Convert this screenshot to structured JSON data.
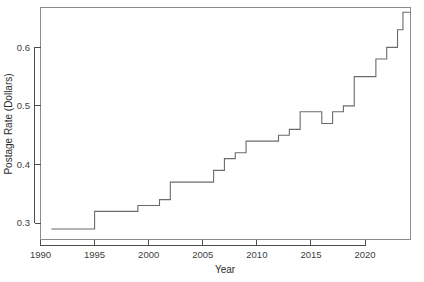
{
  "chart_data": {
    "type": "line",
    "step": "post",
    "title": "",
    "xlabel": "Year",
    "ylabel": "Postage Rate (Dollars)",
    "xlim": [
      1990,
      2024.2
    ],
    "ylim": [
      0.272,
      0.668
    ],
    "xticks": [
      1990,
      1995,
      2000,
      2005,
      2010,
      2015,
      2020
    ],
    "xtick_labels": [
      "1990",
      "1995",
      "2000",
      "2005",
      "2010",
      "2015",
      "2020"
    ],
    "yticks": [
      0.3,
      0.4,
      0.5,
      0.6
    ],
    "ytick_labels": [
      "0.3",
      "0.4",
      "0.5",
      "0.6"
    ],
    "grid": false,
    "legend": false,
    "line_color": "#6b6b6b",
    "x": [
      1991.0,
      1995.0,
      1999.0,
      2001.0,
      2002.0,
      2006.0,
      2007.0,
      2008.0,
      2009.0,
      2012.0,
      2013.0,
      2014.0,
      2016.0,
      2017.0,
      2018.0,
      2019.0,
      2021.0,
      2022.0,
      2023.0,
      2023.5,
      2024.2
    ],
    "values": [
      0.29,
      0.32,
      0.33,
      0.34,
      0.37,
      0.39,
      0.41,
      0.42,
      0.44,
      0.45,
      0.46,
      0.49,
      0.47,
      0.49,
      0.5,
      0.55,
      0.58,
      0.6,
      0.63,
      0.66,
      0.66
    ],
    "series": [
      {
        "name": "Postage Rate",
        "points": [
          {
            "year": 1991.0,
            "rate": 0.29
          },
          {
            "year": 1995.0,
            "rate": 0.32
          },
          {
            "year": 1999.0,
            "rate": 0.33
          },
          {
            "year": 2001.0,
            "rate": 0.34
          },
          {
            "year": 2002.0,
            "rate": 0.37
          },
          {
            "year": 2006.0,
            "rate": 0.39
          },
          {
            "year": 2007.0,
            "rate": 0.41
          },
          {
            "year": 2008.0,
            "rate": 0.42
          },
          {
            "year": 2009.0,
            "rate": 0.44
          },
          {
            "year": 2012.0,
            "rate": 0.45
          },
          {
            "year": 2013.0,
            "rate": 0.46
          },
          {
            "year": 2014.0,
            "rate": 0.49
          },
          {
            "year": 2016.0,
            "rate": 0.47
          },
          {
            "year": 2017.0,
            "rate": 0.49
          },
          {
            "year": 2018.0,
            "rate": 0.5
          },
          {
            "year": 2019.0,
            "rate": 0.55
          },
          {
            "year": 2021.0,
            "rate": 0.58
          },
          {
            "year": 2022.0,
            "rate": 0.6
          },
          {
            "year": 2023.0,
            "rate": 0.63
          },
          {
            "year": 2023.5,
            "rate": 0.66
          }
        ]
      }
    ]
  },
  "axes": {
    "x_title": "Year",
    "y_title": "Postage Rate (Dollars)"
  }
}
